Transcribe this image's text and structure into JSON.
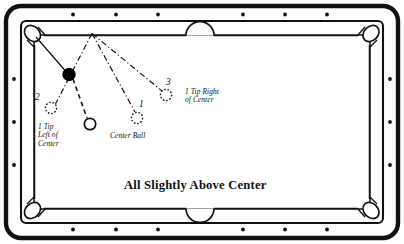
{
  "diagram": {
    "caption": "All Slightly Above Center",
    "colors": {
      "frame": "#111111",
      "cloth": "#ffffff",
      "rail": "#111111",
      "ball_fill": "#000000",
      "line": "#111111"
    },
    "table": {
      "outer_rect": {
        "x": 6,
        "y": 6,
        "w": 392,
        "h": 232,
        "radius": 14
      },
      "rail_border_width": 4,
      "diamonds_top": [
        73,
        116,
        158,
        243,
        285,
        327
      ],
      "diamonds_bottom": [
        73,
        116,
        158,
        243,
        285,
        327
      ],
      "diamonds_left": [
        79,
        122,
        165
      ],
      "diamonds_right": [
        79,
        122,
        165
      ],
      "side_pocket_top": {
        "cx": 200,
        "cy": 31
      },
      "side_pocket_bottom": {
        "cx": 200,
        "cy": 213
      },
      "corner_pockets": [
        {
          "cx": 32,
          "cy": 33
        },
        {
          "cx": 369,
          "cy": 33
        },
        {
          "cx": 32,
          "cy": 211
        },
        {
          "cx": 369,
          "cy": 211
        }
      ]
    },
    "balls": [
      {
        "id": "object-ball",
        "style": "solid",
        "cx": 69,
        "cy": 74,
        "r": 6.2,
        "label": ""
      },
      {
        "id": "cue-ball-center",
        "style": "open",
        "cx": 90,
        "cy": 124,
        "r": 5.6,
        "label": ""
      },
      {
        "id": "ghost-ball-1",
        "style": "dotted",
        "cx": 137,
        "cy": 118,
        "r": 5.6,
        "label": "1"
      },
      {
        "id": "ghost-ball-2",
        "style": "dotted",
        "cx": 51,
        "cy": 108,
        "r": 5.6,
        "label": "2"
      },
      {
        "id": "ghost-ball-3",
        "style": "dotted",
        "cx": 166,
        "cy": 95,
        "r": 5.6,
        "label": "3"
      }
    ],
    "rail_contact_point": {
      "x": 92,
      "y": 33
    },
    "lines": [
      {
        "id": "pocket-to-object",
        "style": "solid",
        "from": [
          36,
          37
        ],
        "to": [
          65,
          71
        ]
      },
      {
        "id": "object-to-cue",
        "style": "dashed",
        "from": [
          73,
          79
        ],
        "to": [
          87,
          119
        ]
      },
      {
        "id": "rail-to-ball2",
        "style": "dashdot",
        "from": [
          92,
          33
        ],
        "to": [
          55,
          104
        ]
      },
      {
        "id": "rail-to-ball1",
        "style": "dashdot",
        "from": [
          92,
          33
        ],
        "to": [
          135,
          112
        ]
      },
      {
        "id": "rail-to-ball3",
        "style": "dashdot",
        "from": [
          92,
          33
        ],
        "to": [
          162,
          91
        ]
      }
    ],
    "labels": {
      "left": "1 Tip\nLeft of\nCenter",
      "center": "Center Ball",
      "right": "1 Tip Right\nof Center"
    },
    "ball_numbers": {
      "one": "1",
      "two": "2",
      "three": "3"
    }
  }
}
